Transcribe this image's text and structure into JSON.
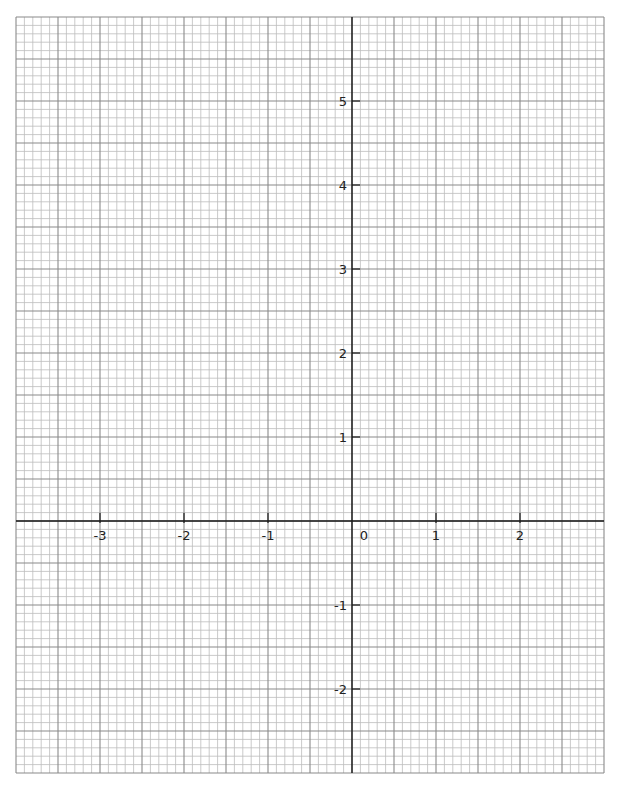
{
  "chart_data": {
    "type": "line",
    "title": "",
    "xlabel": "",
    "ylabel": "",
    "xlim": [
      -4,
      3
    ],
    "ylim": [
      -3,
      6
    ],
    "grid": true,
    "grid_major_step": 0.5,
    "grid_minor_step": 0.1,
    "x_ticks": [
      {
        "value": -3,
        "label": "-3"
      },
      {
        "value": -2,
        "label": "-2"
      },
      {
        "value": -1,
        "label": "-1"
      },
      {
        "value": 1,
        "label": "1"
      },
      {
        "value": 2,
        "label": "2"
      }
    ],
    "y_ticks": [
      {
        "value": 5,
        "label": "5"
      },
      {
        "value": 4,
        "label": "4"
      },
      {
        "value": 3,
        "label": "3"
      },
      {
        "value": 2,
        "label": "2"
      },
      {
        "value": 1,
        "label": "1"
      },
      {
        "value": -1,
        "label": "-1"
      },
      {
        "value": -2,
        "label": "-2"
      }
    ],
    "origin_label": "0",
    "series": []
  },
  "layout": {
    "px_per_unit": 84,
    "origin_px": [
      352,
      521
    ],
    "colors": {
      "minor_grid": "#bdbdbd",
      "major_grid": "#8a8a8a",
      "axis": "#1a1a1a",
      "label": "#222222"
    }
  }
}
